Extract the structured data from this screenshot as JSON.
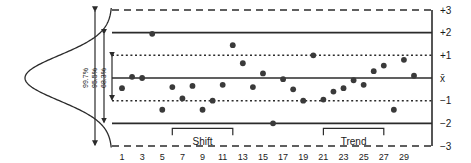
{
  "chart_data": {
    "type": "scatter",
    "title": "",
    "subtitle": "",
    "xlabel": "",
    "ylabel": "",
    "xlim": [
      0,
      30
    ],
    "ylim": [
      -3,
      3
    ],
    "grid": false,
    "legend_position": "none",
    "x": [
      1,
      2,
      3,
      4,
      5,
      6,
      7,
      8,
      9,
      10,
      11,
      12,
      13,
      14,
      15,
      16,
      17,
      18,
      19,
      20,
      21,
      22,
      23,
      24,
      25,
      26,
      27,
      28,
      29,
      30
    ],
    "values": [
      -0.45,
      0.05,
      0.0,
      1.95,
      -1.4,
      -0.4,
      -0.9,
      -0.35,
      -1.4,
      -1.0,
      -0.3,
      1.45,
      0.65,
      -0.4,
      0.2,
      -2.0,
      -0.05,
      -0.5,
      -1.0,
      1.0,
      -0.95,
      -0.6,
      -0.45,
      -0.1,
      -0.3,
      0.3,
      0.55,
      -1.4,
      0.8,
      0.1
    ],
    "reference_lines": [
      {
        "label": "+3",
        "value": 3,
        "style": "dashed"
      },
      {
        "label": "+2",
        "value": 2,
        "style": "solid"
      },
      {
        "label": "+1",
        "value": 1,
        "style": "dotted"
      },
      {
        "label": "x̄",
        "value": 0,
        "style": "solid"
      },
      {
        "label": "−1",
        "value": -1,
        "style": "dotted"
      },
      {
        "label": "−2",
        "value": -2,
        "style": "solid"
      },
      {
        "label": "−3",
        "value": -3,
        "style": "dashed"
      }
    ],
    "y_tick_labels": [
      "+3",
      "+2",
      "+1",
      "x̄",
      "−1",
      "−2",
      "−3"
    ],
    "x_tick_labels": [
      "1",
      "3",
      "5",
      "7",
      "9",
      "11",
      "13",
      "15",
      "17",
      "19",
      "21",
      "23",
      "25",
      "27",
      "29"
    ],
    "x_tick_values": [
      1,
      3,
      5,
      7,
      9,
      11,
      13,
      15,
      17,
      19,
      21,
      23,
      25,
      27,
      29
    ],
    "distribution_curve": {
      "name": "normal-distribution",
      "orientation": "vertical",
      "position": "left"
    },
    "sigma_bands": [
      {
        "label": "68.3%",
        "span": [
          -1,
          1
        ]
      },
      {
        "label": "95.5%",
        "span": [
          -2,
          2
        ]
      },
      {
        "label": "99.7%",
        "span": [
          -3,
          3
        ]
      }
    ],
    "annotations": [
      {
        "label": "Shift",
        "from_x": 6,
        "to_x": 12
      },
      {
        "label": "Trend",
        "from_x": 21,
        "to_x": 27
      }
    ],
    "colors": {
      "line": "#2b2b2b",
      "point": "#3a3a3a",
      "background": "#ffffff",
      "text": "#1a1a1a"
    }
  }
}
